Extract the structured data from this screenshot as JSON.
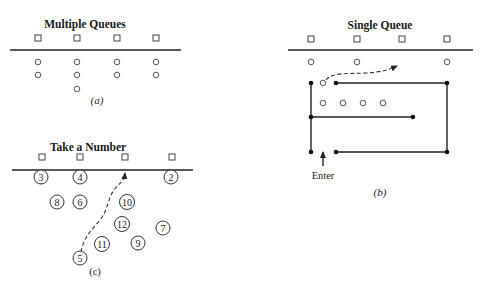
{
  "panels": {
    "a": {
      "title": "Multiple Queues",
      "caption": "(a)",
      "servers": [
        {
          "x": 38,
          "y": 38
        },
        {
          "x": 77,
          "y": 38
        },
        {
          "x": 117,
          "y": 38
        },
        {
          "x": 156,
          "y": 38
        }
      ],
      "counter": {
        "x1": 10,
        "x2": 181,
        "y": 50
      },
      "queue_lengths": [
        2,
        3,
        2,
        2
      ],
      "customers": [
        {
          "x": 38,
          "y": 62
        },
        {
          "x": 38,
          "y": 75
        },
        {
          "x": 77,
          "y": 62
        },
        {
          "x": 77,
          "y": 75
        },
        {
          "x": 77,
          "y": 89
        },
        {
          "x": 117,
          "y": 62
        },
        {
          "x": 117,
          "y": 75
        },
        {
          "x": 156,
          "y": 62
        },
        {
          "x": 156,
          "y": 75
        }
      ]
    },
    "b": {
      "title": "Single Queue",
      "caption": "(b)",
      "enter_label": "Enter",
      "servers": [
        {
          "x": 311,
          "y": 39
        },
        {
          "x": 357,
          "y": 39
        },
        {
          "x": 402,
          "y": 39
        },
        {
          "x": 447,
          "y": 39
        }
      ],
      "counter": {
        "x1": 288,
        "x2": 473,
        "y": 50
      },
      "served_customers": [
        {
          "x": 311,
          "y": 62
        },
        {
          "x": 357,
          "y": 62
        },
        {
          "x": 447,
          "y": 62
        }
      ],
      "waiting_customers": [
        {
          "x": 323,
          "y": 83
        },
        {
          "x": 323,
          "y": 103
        },
        {
          "x": 343,
          "y": 103
        },
        {
          "x": 363,
          "y": 103
        },
        {
          "x": 383,
          "y": 103
        }
      ],
      "posts": [
        {
          "x": 311,
          "y": 83
        },
        {
          "x": 336,
          "y": 83
        },
        {
          "x": 447,
          "y": 83
        },
        {
          "x": 311,
          "y": 117
        },
        {
          "x": 413,
          "y": 117
        },
        {
          "x": 311,
          "y": 152
        },
        {
          "x": 336,
          "y": 152
        },
        {
          "x": 447,
          "y": 152
        }
      ]
    },
    "c": {
      "title": "Take a Number",
      "caption": "(c)",
      "servers": [
        {
          "x": 42,
          "y": 157
        },
        {
          "x": 80,
          "y": 157
        },
        {
          "x": 125,
          "y": 157
        },
        {
          "x": 172,
          "y": 157
        }
      ],
      "counter": {
        "x1": 12,
        "x2": 193,
        "y": 170
      },
      "tickets": [
        {
          "n": "3",
          "x": 41,
          "y": 177
        },
        {
          "n": "4",
          "x": 80,
          "y": 177
        },
        {
          "n": "2",
          "x": 171,
          "y": 177
        },
        {
          "n": "8",
          "x": 57,
          "y": 202
        },
        {
          "n": "6",
          "x": 80,
          "y": 202
        },
        {
          "n": "10",
          "x": 127,
          "y": 202
        },
        {
          "n": "12",
          "x": 122,
          "y": 224
        },
        {
          "n": "7",
          "x": 163,
          "y": 228
        },
        {
          "n": "11",
          "x": 102,
          "y": 244
        },
        {
          "n": "9",
          "x": 138,
          "y": 243
        },
        {
          "n": "5",
          "x": 80,
          "y": 258
        }
      ]
    }
  }
}
